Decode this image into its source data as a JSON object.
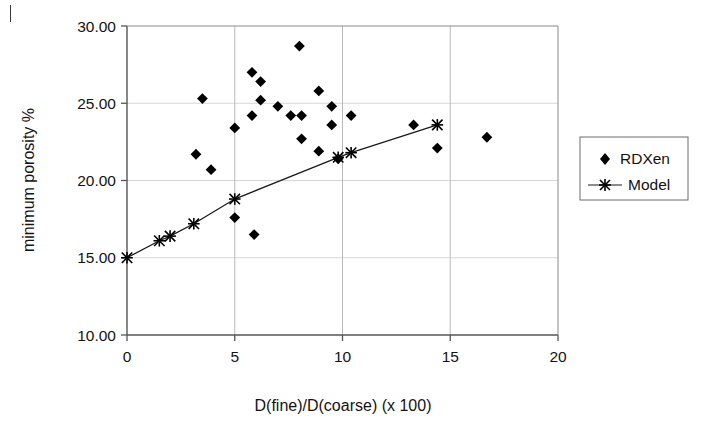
{
  "figure": {
    "name": "minimum-porosity-scatter-figure",
    "background_color": "#ffffff",
    "foreground_color": "#131313",
    "page_mark": "|"
  },
  "chart_data": {
    "type": "scatter",
    "title": "",
    "xlabel": "D(fine)/D(coarse) (x 100)",
    "ylabel": "minimum porosity %",
    "xlim": [
      0,
      20
    ],
    "ylim": [
      10.0,
      30.0
    ],
    "xticks": [
      0,
      5,
      10,
      15,
      20
    ],
    "yticks": [
      10.0,
      15.0,
      20.0,
      25.0,
      30.0
    ],
    "xtick_labels": [
      "0",
      "5",
      "10",
      "15",
      "20"
    ],
    "ytick_labels": [
      "10.00",
      "15.00",
      "20.00",
      "25.00",
      "30.00"
    ],
    "grid": true,
    "legend_position": "right-outside",
    "series": [
      {
        "name": "RDXen",
        "marker": "diamond",
        "line": "none",
        "color": "#000000",
        "points": [
          {
            "x": 3.5,
            "y": 25.3
          },
          {
            "x": 3.2,
            "y": 21.7
          },
          {
            "x": 3.9,
            "y": 20.7
          },
          {
            "x": 5.0,
            "y": 23.4
          },
          {
            "x": 5.0,
            "y": 17.6
          },
          {
            "x": 5.8,
            "y": 27.0
          },
          {
            "x": 5.8,
            "y": 24.2
          },
          {
            "x": 5.9,
            "y": 16.5
          },
          {
            "x": 6.2,
            "y": 26.4
          },
          {
            "x": 6.2,
            "y": 25.2
          },
          {
            "x": 7.0,
            "y": 24.8
          },
          {
            "x": 7.6,
            "y": 24.2
          },
          {
            "x": 8.1,
            "y": 24.2
          },
          {
            "x": 8.0,
            "y": 28.7
          },
          {
            "x": 8.1,
            "y": 22.7
          },
          {
            "x": 8.9,
            "y": 25.8
          },
          {
            "x": 8.9,
            "y": 21.9
          },
          {
            "x": 9.5,
            "y": 24.8
          },
          {
            "x": 9.5,
            "y": 23.6
          },
          {
            "x": 9.8,
            "y": 21.4
          },
          {
            "x": 10.4,
            "y": 24.2
          },
          {
            "x": 13.3,
            "y": 23.6
          },
          {
            "x": 14.4,
            "y": 22.1
          },
          {
            "x": 16.7,
            "y": 22.8
          }
        ]
      },
      {
        "name": "Model",
        "marker": "asterisk",
        "line": "solid",
        "color": "#1a1a1a",
        "points": [
          {
            "x": 0.0,
            "y": 15.0
          },
          {
            "x": 1.5,
            "y": 16.1
          },
          {
            "x": 2.0,
            "y": 16.4
          },
          {
            "x": 3.1,
            "y": 17.2
          },
          {
            "x": 5.0,
            "y": 18.8
          },
          {
            "x": 9.8,
            "y": 21.5
          },
          {
            "x": 10.4,
            "y": 21.8
          },
          {
            "x": 14.4,
            "y": 23.6
          }
        ]
      }
    ],
    "legend_entries": [
      {
        "label": "RDXen",
        "marker": "diamond"
      },
      {
        "label": "Model",
        "marker": "asterisk-line"
      }
    ]
  }
}
